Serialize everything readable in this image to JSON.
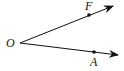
{
  "diagram": {
    "type": "angle",
    "vertex": {
      "label": "O",
      "x": 20,
      "y": 43
    },
    "rays": [
      {
        "name": "ray-OF",
        "point": {
          "label": "F",
          "x": 89,
          "y": 15
        },
        "tip": {
          "x": 113,
          "y": 6
        }
      },
      {
        "name": "ray-OA",
        "point": {
          "label": "A",
          "x": 94,
          "y": 52
        },
        "tip": {
          "x": 118,
          "y": 55
        }
      }
    ],
    "colors": {
      "line": "#111111",
      "background": "#ffffff"
    }
  }
}
